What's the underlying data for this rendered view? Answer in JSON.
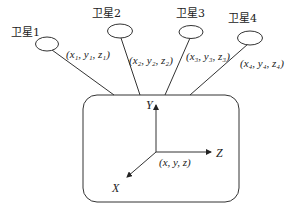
{
  "diagram": {
    "title": "",
    "satellites": [
      {
        "label": "卫星1",
        "coord": "(x₁, y₁, z₁)"
      },
      {
        "label": "卫星2",
        "coord": "(x₂, y₂, z₂)"
      },
      {
        "label": "卫星3",
        "coord": "(x₃, y₃, z₃)"
      },
      {
        "label": "卫星4",
        "coord": "(x₄, y₄, z₄)"
      }
    ],
    "receiver": {
      "coord": "(x, y, z)",
      "axes": {
        "x": "X",
        "y": "Y",
        "z": "Z"
      }
    }
  }
}
